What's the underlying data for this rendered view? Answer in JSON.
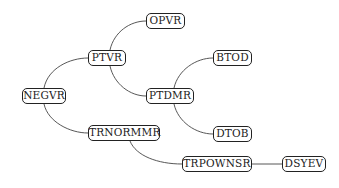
{
  "diagram": {
    "type": "call-tree",
    "nodes": [
      {
        "id": "NEGVR",
        "label": "NEGVR",
        "x": 22,
        "y": 88,
        "w": 44
      },
      {
        "id": "PTVR",
        "label": "PTVR",
        "x": 88,
        "y": 50,
        "w": 38
      },
      {
        "id": "OPVR",
        "label": "OPVR",
        "x": 146,
        "y": 13,
        "w": 39
      },
      {
        "id": "PTDMR",
        "label": "PTDMR",
        "x": 146,
        "y": 88,
        "w": 48
      },
      {
        "id": "BTOD",
        "label": "BTOD",
        "x": 213,
        "y": 50,
        "w": 39
      },
      {
        "id": "DTOB",
        "label": "DTOB",
        "x": 213,
        "y": 126,
        "w": 39
      },
      {
        "id": "TRNORMMR",
        "label": "TRNORMMR",
        "x": 88,
        "y": 125,
        "w": 72
      },
      {
        "id": "TRPOWNSR",
        "label": "TRPOWNSR",
        "x": 182,
        "y": 156,
        "w": 70
      },
      {
        "id": "DSYEV",
        "label": "DSYEV",
        "x": 282,
        "y": 156,
        "w": 44
      }
    ],
    "edges": [
      {
        "from": "NEGVR",
        "to": "PTVR"
      },
      {
        "from": "NEGVR",
        "to": "TRNORMMR"
      },
      {
        "from": "PTVR",
        "to": "OPVR"
      },
      {
        "from": "PTVR",
        "to": "PTDMR"
      },
      {
        "from": "PTDMR",
        "to": "BTOD"
      },
      {
        "from": "PTDMR",
        "to": "DTOB"
      },
      {
        "from": "TRNORMMR",
        "to": "TRPOWNSR"
      },
      {
        "from": "TRPOWNSR",
        "to": "DSYEV"
      }
    ],
    "colors": {
      "stroke": "#222222",
      "edge": "#444444",
      "background": "#ffffff"
    }
  }
}
